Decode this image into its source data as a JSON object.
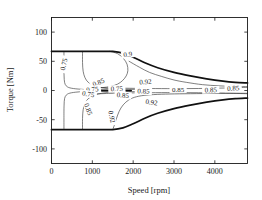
{
  "figure": {
    "kind": "efficiency-contour-map",
    "background_color": "#ffffff",
    "line_color": "#111111",
    "contour_color": "#3b3b3b"
  },
  "chart_data": {
    "type": "line",
    "title": "",
    "subtitle": "",
    "xlabel": "Speed [rpm]",
    "ylabel": "Torque [Nm]",
    "xlim": [
      0,
      4800
    ],
    "ylim": [
      -125,
      125
    ],
    "xticks": [
      0,
      1000,
      2000,
      3000,
      4000
    ],
    "xticklabels": [
      "0",
      "1000",
      "2000",
      "3000",
      "4000"
    ],
    "yticks": [
      -100,
      -50,
      0,
      50,
      100
    ],
    "yticklabels": [
      "-100",
      "-50",
      "0",
      "50",
      "100"
    ],
    "grid": false,
    "legend": null,
    "legend_position": "none",
    "annotations": [
      {
        "text": "0.75",
        "x": 300,
        "y": 45,
        "rotation": -78
      },
      {
        "text": "0.85",
        "x": 1150,
        "y": 14,
        "rotation": -22
      },
      {
        "text": "0.9",
        "x": 1870,
        "y": 62,
        "rotation": -8
      },
      {
        "text": "0.92",
        "x": 2300,
        "y": 15,
        "rotation": -4
      },
      {
        "text": "0.75",
        "x": 1000,
        "y": 2,
        "rotation": -6
      },
      {
        "text": "0.75",
        "x": 1600,
        "y": 3,
        "rotation": -2
      },
      {
        "text": "0.85",
        "x": 2250,
        "y": -1,
        "rotation": 3
      },
      {
        "text": "0.85",
        "x": 3100,
        "y": 2,
        "rotation": 0
      },
      {
        "text": "0.85",
        "x": 3900,
        "y": 1,
        "rotation": -2
      },
      {
        "text": "0.85",
        "x": 4450,
        "y": 4,
        "rotation": -3
      },
      {
        "text": "0.75",
        "x": 900,
        "y": -6,
        "rotation": 10
      },
      {
        "text": "0.85",
        "x": 1750,
        "y": -8,
        "rotation": 6
      },
      {
        "text": "0.85",
        "x": 900,
        "y": -32,
        "rotation": 70
      },
      {
        "text": "0.92",
        "x": 1480,
        "y": -45,
        "rotation": 78
      },
      {
        "text": "0.92",
        "x": 2450,
        "y": -20,
        "rotation": 8
      }
    ],
    "envelope": {
      "name": "Peak torque envelope",
      "description": "Motor operating limit: constant torque to base speed, then field weakening",
      "corner_speed_rpm": 1500,
      "peak_torque_nm": 67,
      "max_speed_rpm": 4800,
      "torque_at_max_speed_nm": 13,
      "upper_points": [
        [
          0,
          67
        ],
        [
          400,
          67
        ],
        [
          800,
          67
        ],
        [
          1200,
          67
        ],
        [
          1500,
          67
        ],
        [
          1750,
          64
        ],
        [
          2000,
          57
        ],
        [
          2300,
          47
        ],
        [
          2600,
          39
        ],
        [
          3000,
          31
        ],
        [
          3400,
          25
        ],
        [
          3800,
          20
        ],
        [
          4200,
          16
        ],
        [
          4500,
          14
        ],
        [
          4800,
          13
        ]
      ],
      "lower_points": [
        [
          0,
          -67
        ],
        [
          400,
          -67
        ],
        [
          800,
          -67
        ],
        [
          1200,
          -67
        ],
        [
          1500,
          -67
        ],
        [
          1750,
          -64
        ],
        [
          2000,
          -57
        ],
        [
          2300,
          -47
        ],
        [
          2600,
          -39
        ],
        [
          3000,
          -31
        ],
        [
          3400,
          -25
        ],
        [
          3800,
          -20
        ],
        [
          4200,
          -16
        ],
        [
          4500,
          -14
        ],
        [
          4800,
          -13
        ]
      ]
    },
    "zero_torque_bar": {
      "name": "zero-torque-marker",
      "from_speed_rpm": 1150,
      "to_speed_rpm": 1950,
      "torque_nm": 0
    },
    "series": [
      {
        "name": "eta = 0.75 (upper, low speed)",
        "level": 0.75,
        "points": [
          [
            305,
            67
          ],
          [
            305,
            40
          ],
          [
            308,
            25
          ],
          [
            320,
            14
          ],
          [
            360,
            8
          ],
          [
            450,
            4.5
          ],
          [
            650,
            2.5
          ],
          [
            900,
            1.6
          ],
          [
            1200,
            1.2
          ],
          [
            1500,
            1.0
          ]
        ]
      },
      {
        "name": "eta = 0.85 (upper, low speed)",
        "level": 0.85,
        "points": [
          [
            760,
            67
          ],
          [
            760,
            48
          ],
          [
            775,
            33
          ],
          [
            820,
            22
          ],
          [
            900,
            14
          ],
          [
            1050,
            8
          ],
          [
            1250,
            4.5
          ],
          [
            1500,
            3
          ],
          [
            1800,
            2.2
          ],
          [
            2100,
            1.8
          ]
        ]
      },
      {
        "name": "eta = 0.9 (upper closed lobe)",
        "level": 0.9,
        "points": [
          [
            1430,
            67
          ],
          [
            1620,
            63
          ],
          [
            1760,
            55
          ],
          [
            1850,
            45
          ],
          [
            1870,
            34
          ],
          [
            1830,
            25
          ],
          [
            1740,
            17
          ],
          [
            1620,
            11
          ],
          [
            1450,
            7
          ],
          [
            1250,
            5
          ],
          [
            1050,
            4.5
          ]
        ]
      },
      {
        "name": "eta = 0.92 (upper)",
        "level": 0.92,
        "points": [
          [
            1900,
            50
          ],
          [
            2150,
            40
          ],
          [
            2400,
            31
          ],
          [
            2700,
            24
          ],
          [
            3000,
            18
          ],
          [
            3300,
            14
          ],
          [
            3700,
            10
          ],
          [
            4100,
            8
          ],
          [
            4500,
            7
          ],
          [
            4800,
            6.5
          ]
        ]
      },
      {
        "name": "eta = 0.85 (upper, high speed tail)",
        "level": 0.85,
        "points": [
          [
            1000,
            6
          ],
          [
            1400,
            4.5
          ],
          [
            1900,
            3.8
          ],
          [
            2400,
            3.4
          ],
          [
            3000,
            3.2
          ],
          [
            3600,
            3.4
          ],
          [
            4200,
            4.2
          ],
          [
            4800,
            5.5
          ]
        ]
      },
      {
        "name": "eta = 0.75 (lower, mirror low speed)",
        "level": 0.75,
        "points": [
          [
            305,
            -67
          ],
          [
            305,
            -40
          ],
          [
            308,
            -25
          ],
          [
            320,
            -14
          ],
          [
            360,
            -8
          ],
          [
            450,
            -4.5
          ],
          [
            650,
            -2.5
          ],
          [
            900,
            -1.6
          ],
          [
            1200,
            -1.2
          ],
          [
            1500,
            -1.0
          ]
        ]
      },
      {
        "name": "eta = 0.85 (lower, mirror low speed)",
        "level": 0.85,
        "points": [
          [
            760,
            -67
          ],
          [
            760,
            -48
          ],
          [
            775,
            -33
          ],
          [
            820,
            -22
          ],
          [
            900,
            -14
          ],
          [
            1050,
            -8
          ],
          [
            1250,
            -4.5
          ],
          [
            1500,
            -3
          ],
          [
            1800,
            -2.2
          ],
          [
            2100,
            -1.8
          ]
        ]
      },
      {
        "name": "eta = 0.92 (lower closed lobe start)",
        "level": 0.92,
        "points": [
          [
            1500,
            -67
          ],
          [
            1560,
            -55
          ],
          [
            1620,
            -42
          ],
          [
            1700,
            -30
          ],
          [
            1820,
            -20
          ],
          [
            1980,
            -13
          ],
          [
            2200,
            -9
          ],
          [
            2500,
            -7
          ],
          [
            2900,
            -6
          ],
          [
            3400,
            -5.5
          ],
          [
            4000,
            -5
          ],
          [
            4500,
            -4.8
          ],
          [
            4800,
            -4.8
          ]
        ]
      },
      {
        "name": "eta = 0.85 (lower tail)",
        "level": 0.85,
        "points": [
          [
            1000,
            -6
          ],
          [
            1400,
            -5
          ],
          [
            1900,
            -4.2
          ],
          [
            2400,
            -3.8
          ],
          [
            3000,
            -3.6
          ],
          [
            3600,
            -3.8
          ],
          [
            4200,
            -4.5
          ],
          [
            4800,
            -5.5
          ]
        ]
      }
    ]
  }
}
